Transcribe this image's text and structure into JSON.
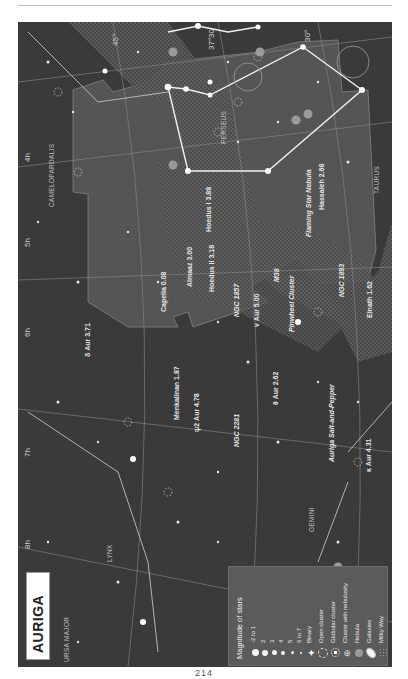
{
  "chart_title": "AURIGA",
  "page_number": "214",
  "orientation": "rotated -90deg (landscape chart on portrait page)",
  "colors": {
    "sky": "#3a3a3a",
    "constellation_area": "#555555",
    "milky_way": "#606060",
    "lines": "#f0f0f0",
    "grid": "#8a8a8a",
    "nebula": "#9a9a9a",
    "legend_bg": "#5b5b5b"
  },
  "coordinates": {
    "right_ascension": [
      "4h",
      "5h",
      "6h",
      "7h",
      "8h"
    ],
    "declination": [
      "45°",
      "37°30'",
      "30°"
    ]
  },
  "constellations": [
    "CAMELOPARDALIS",
    "PERSEUS",
    "TAURUS",
    "GEMINI",
    "LYNX",
    "URSA MAJOR"
  ],
  "stars": [
    {
      "name": "Capella 0.08"
    },
    {
      "name": "Almaaz 3.00"
    },
    {
      "name": "Hoedus I 3.88"
    },
    {
      "name": "Hoedus II 3.18"
    },
    {
      "name": "Hassaleh 2.68"
    },
    {
      "name": "Elnath 1.62"
    },
    {
      "name": "θ Aur 2.62"
    },
    {
      "name": "Menkalinan 1.87"
    },
    {
      "name": "δ Aur 3.71"
    },
    {
      "name": "ψ2 Aur 4.78"
    },
    {
      "name": "ν Aur 5.00"
    },
    {
      "name": "κ Aur 4.31"
    }
  ],
  "deep_sky": [
    {
      "name": "Flaming Star Nebula"
    },
    {
      "name": "NGC 1893"
    },
    {
      "name": "M38"
    },
    {
      "name": "NGC 1857"
    },
    {
      "name": "Pinwheel Cluster"
    },
    {
      "name": "Auriga Salt-and-Pepper"
    },
    {
      "name": "NGC 2281"
    }
  ],
  "legend": {
    "title": "Magnitude of stars",
    "items": [
      {
        "label": "-2 to 1",
        "symbol": "star-mag-1"
      },
      {
        "label": "2",
        "symbol": "star-mag-2"
      },
      {
        "label": "3",
        "symbol": "star-mag-3"
      },
      {
        "label": "4",
        "symbol": "star-mag-4"
      },
      {
        "label": "5",
        "symbol": "star-mag-5"
      },
      {
        "label": "6 to 7",
        "symbol": "star-mag-6"
      },
      {
        "label": "Binary",
        "symbol": "binary-star"
      },
      {
        "label": "Open cluster",
        "symbol": "open-cluster"
      },
      {
        "label": "Globular cluster",
        "symbol": "globular-cluster"
      },
      {
        "label": "Cluster with nebulosity",
        "symbol": "cluster-nebulosity"
      },
      {
        "label": "Nebula",
        "symbol": "nebula"
      },
      {
        "label": "Galaxies",
        "symbol": "galaxy"
      },
      {
        "label": "Milky Way",
        "symbol": "milky-way"
      }
    ]
  }
}
